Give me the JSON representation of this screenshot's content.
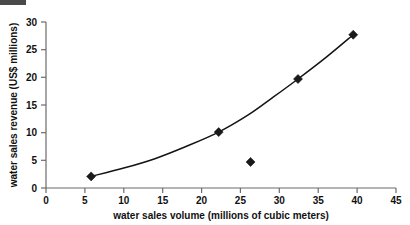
{
  "chart_data": {
    "type": "scatter",
    "title": "",
    "xlabel": "water sales volume (millions of cubic meters)",
    "ylabel": "water sales revenue (US$ millions)",
    "xlim": [
      0,
      45
    ],
    "ylim": [
      0,
      30
    ],
    "xticks": [
      0,
      5,
      10,
      15,
      20,
      25,
      30,
      35,
      40,
      45
    ],
    "yticks": [
      0,
      5,
      10,
      15,
      20,
      25,
      30
    ],
    "xtick_labels": [
      "0",
      "5",
      "10",
      "15",
      "20",
      "25",
      "30",
      "35",
      "40",
      "45"
    ],
    "ytick_labels": [
      "0",
      "5",
      "10",
      "15",
      "20",
      "25",
      "30"
    ],
    "grid": false,
    "legend": "none",
    "marker_style": "filled-diamond",
    "marker_color": "#1a1a1a",
    "curve_color": "#141414",
    "axis_color": "#6b6b6b",
    "background_color": "#ffffff",
    "points": [
      {
        "x": 5.8,
        "y": 2.1,
        "on_curve": true
      },
      {
        "x": 22.2,
        "y": 10.1,
        "on_curve": true
      },
      {
        "x": 26.3,
        "y": 4.7,
        "on_curve": false
      },
      {
        "x": 32.4,
        "y": 19.7,
        "on_curve": true
      },
      {
        "x": 39.5,
        "y": 27.7,
        "on_curve": true
      }
    ],
    "series": [
      {
        "name": "water sales",
        "x": [
          5.8,
          22.2,
          26.3,
          32.4,
          39.5
        ],
        "values": [
          2.1,
          10.1,
          4.7,
          19.7,
          27.7
        ]
      }
    ],
    "fitted_curve": {
      "description": "smooth increasing convex trend line through the four on-curve points",
      "x": [
        5.8,
        10.0,
        14.0,
        18.0,
        22.2,
        26.0,
        29.0,
        32.4,
        36.0,
        39.5
      ],
      "y": [
        2.1,
        3.6,
        5.3,
        7.5,
        10.1,
        13.2,
        16.2,
        19.7,
        23.6,
        27.7
      ]
    },
    "annotations": []
  },
  "axes": {
    "x_title": "water sales volume (millions of cubic meters)",
    "y_title": "water sales revenue (US$ millions)"
  }
}
